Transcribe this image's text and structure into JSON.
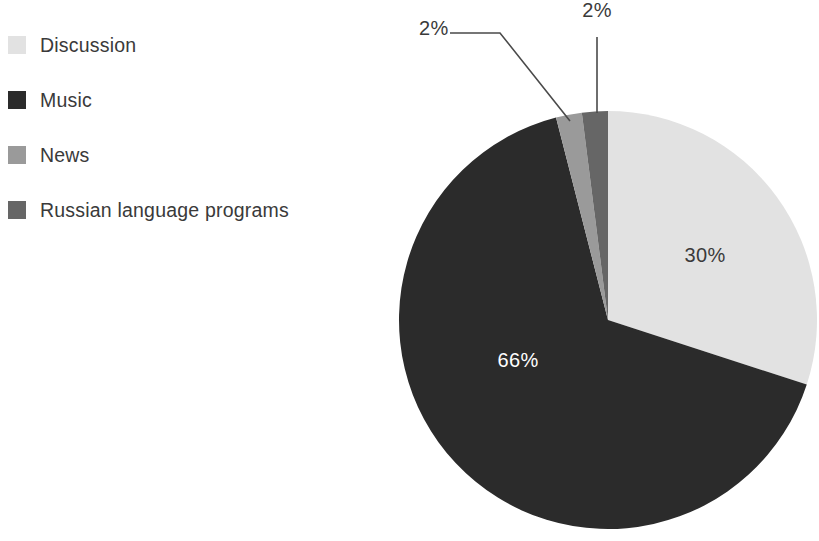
{
  "chart_data": {
    "type": "pie",
    "title": "",
    "categories": [
      "Discussion",
      "Music",
      "News",
      "Russian language programs"
    ],
    "values": [
      30,
      66,
      2,
      2
    ],
    "value_labels": [
      "30%",
      "66%",
      "2%",
      "2%"
    ],
    "colors": [
      "#e2e2e2",
      "#2b2b2b",
      "#9a9a9a",
      "#666666"
    ],
    "label_text_colors": [
      "#3a3a3a",
      "#ffffff",
      "#3a3a3a",
      "#3a3a3a"
    ],
    "units": "percent",
    "start_angle_deg": 0,
    "direction": "clockwise",
    "slice_order_clockwise_from_top": [
      "Discussion",
      "Music",
      "News",
      "Russian language programs"
    ],
    "legend_position": "left",
    "grid": false,
    "xlabel": "",
    "ylabel": ""
  },
  "legend": {
    "items": [
      {
        "label": "Discussion",
        "color": "#e2e2e2",
        "value_label": "30%"
      },
      {
        "label": "Music",
        "color": "#2b2b2b",
        "value_label": "66%"
      },
      {
        "label": "News",
        "color": "#9a9a9a",
        "value_label": "2%"
      },
      {
        "label": "Russian language programs",
        "color": "#666666",
        "value_label": "2%"
      }
    ]
  },
  "pie": {
    "center_x": 608,
    "center_y": 320,
    "radius": 209,
    "inner_labels": [
      {
        "name": "discussion-value",
        "text": "30%",
        "x": 705,
        "y": 262,
        "color": "#3a3a3a"
      },
      {
        "name": "music-value",
        "text": "66%",
        "x": 518,
        "y": 367,
        "color": "#ffffff"
      }
    ],
    "callouts": [
      {
        "name": "news-value",
        "text": "2%",
        "x": 419,
        "y": 21,
        "anchor": "start"
      },
      {
        "name": "russian-value",
        "text": "2%",
        "x": 597,
        "y": 21,
        "anchor": "middle"
      }
    ]
  }
}
